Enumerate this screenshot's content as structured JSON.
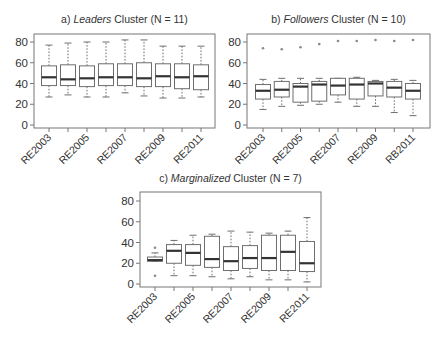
{
  "chart_data": [
    {
      "type": "boxplot",
      "panel": "a",
      "title_prefix": "a) ",
      "title_italic": "Leaders",
      "title_suffix": " Cluster (N = 11)",
      "xlabel": "",
      "ylabel": "",
      "ylim": [
        0,
        85
      ],
      "yticks": [
        0,
        20,
        40,
        60,
        80
      ],
      "categories": [
        "RE2003",
        "RE2004",
        "RE2005",
        "RE2006",
        "RE2007",
        "RE2008",
        "RE2009",
        "RE2010",
        "RE2011"
      ],
      "tick_labels": [
        "RE2003",
        "",
        "RE2005",
        "",
        "RE2007",
        "",
        "RE2009",
        "",
        "RE2011"
      ],
      "series": [
        {
          "min": 27,
          "q1": 38,
          "median": 46,
          "q3": 57,
          "max": 77,
          "outliers": []
        },
        {
          "min": 29,
          "q1": 38,
          "median": 44,
          "q3": 58,
          "max": 79,
          "outliers": []
        },
        {
          "min": 27,
          "q1": 37,
          "median": 45,
          "q3": 57,
          "max": 80,
          "outliers": []
        },
        {
          "min": 27,
          "q1": 38,
          "median": 46,
          "q3": 59,
          "max": 80,
          "outliers": []
        },
        {
          "min": 31,
          "q1": 38,
          "median": 46,
          "q3": 59,
          "max": 82,
          "outliers": []
        },
        {
          "min": 28,
          "q1": 37,
          "median": 45,
          "q3": 60,
          "max": 82,
          "outliers": []
        },
        {
          "min": 26,
          "q1": 37,
          "median": 47,
          "q3": 59,
          "max": 76,
          "outliers": []
        },
        {
          "min": 26,
          "q1": 35,
          "median": 46,
          "q3": 59,
          "max": 76,
          "outliers": []
        },
        {
          "min": 27,
          "q1": 34,
          "median": 47,
          "q3": 58,
          "max": 76,
          "outliers": []
        }
      ]
    },
    {
      "type": "boxplot",
      "panel": "b",
      "title_prefix": "b) ",
      "title_italic": "Followers",
      "title_suffix": " Cluster (N = 10)",
      "xlabel": "",
      "ylabel": "",
      "ylim": [
        0,
        85
      ],
      "yticks": [
        0,
        20,
        40,
        60,
        80
      ],
      "categories": [
        "RE2003",
        "RE2004",
        "RE2005",
        "RE2006",
        "RE2007",
        "RE2008",
        "RE2009",
        "RE2010",
        "RB2011"
      ],
      "tick_labels": [
        "RE2003",
        "",
        "RE2005",
        "",
        "RE2007",
        "",
        "RE2009",
        "",
        "RB2011"
      ],
      "series": [
        {
          "min": 15,
          "q1": 25,
          "median": 33,
          "q3": 39,
          "max": 44,
          "outliers": [
            74
          ]
        },
        {
          "min": 18,
          "q1": 27,
          "median": 34,
          "q3": 42,
          "max": 45,
          "outliers": [
            73
          ]
        },
        {
          "min": 19,
          "q1": 22,
          "median": 37,
          "q3": 40,
          "max": 45,
          "outliers": [
            75
          ]
        },
        {
          "min": 20,
          "q1": 23,
          "median": 39,
          "q3": 42,
          "max": 45,
          "outliers": [
            78
          ]
        },
        {
          "min": 22,
          "q1": 29,
          "median": 38,
          "q3": 45,
          "max": 45,
          "outliers": [
            81
          ]
        },
        {
          "min": 18,
          "q1": 25,
          "median": 39,
          "q3": 45,
          "max": 46,
          "outliers": [
            81
          ]
        },
        {
          "min": 18,
          "q1": 28,
          "median": 40,
          "q3": 42,
          "max": 43,
          "outliers": [
            82
          ]
        },
        {
          "min": 12,
          "q1": 27,
          "median": 36,
          "q3": 42,
          "max": 44,
          "outliers": [
            81
          ]
        },
        {
          "min": 9,
          "q1": 25,
          "median": 33,
          "q3": 40,
          "max": 43,
          "outliers": [
            82
          ]
        }
      ]
    },
    {
      "type": "boxplot",
      "panel": "c",
      "title_prefix": "c) ",
      "title_italic": "Marginalized",
      "title_suffix": " Cluster (N = 7)",
      "xlabel": "",
      "ylabel": "",
      "ylim": [
        0,
        85
      ],
      "yticks": [
        0,
        20,
        40,
        60,
        80
      ],
      "categories": [
        "RE2003",
        "RE2004",
        "RE2005",
        "RE2006",
        "RE2007",
        "RE2008",
        "RE2009",
        "RE2010",
        "RE2011"
      ],
      "tick_labels": [
        "RE2003",
        "",
        "RE2005",
        "",
        "RE2007",
        "",
        "RE2009",
        "",
        "RE2011"
      ],
      "series": [
        {
          "min": 22,
          "q1": 22,
          "median": 23,
          "q3": 26,
          "max": 30,
          "outliers": [
            35,
            8
          ]
        },
        {
          "min": 8,
          "q1": 20,
          "median": 32,
          "q3": 38,
          "max": 42,
          "outliers": []
        },
        {
          "min": 8,
          "q1": 18,
          "median": 30,
          "q3": 38,
          "max": 47,
          "outliers": []
        },
        {
          "min": 7,
          "q1": 16,
          "median": 24,
          "q3": 46,
          "max": 48,
          "outliers": []
        },
        {
          "min": 5,
          "q1": 13,
          "median": 22,
          "q3": 36,
          "max": 51,
          "outliers": []
        },
        {
          "min": 7,
          "q1": 15,
          "median": 25,
          "q3": 37,
          "max": 50,
          "outliers": []
        },
        {
          "min": 4,
          "q1": 13,
          "median": 25,
          "q3": 47,
          "max": 49,
          "outliers": []
        },
        {
          "min": 4,
          "q1": 13,
          "median": 31,
          "q3": 47,
          "max": 51,
          "outliers": []
        },
        {
          "min": 2,
          "q1": 12,
          "median": 20,
          "q3": 41,
          "max": 64,
          "outliers": []
        }
      ]
    }
  ],
  "layout": [
    {
      "left": 34,
      "right": 215,
      "top": 34,
      "bottom": 128,
      "y0": 125,
      "y80": 42,
      "title_y": 23,
      "first_tick_x": 49,
      "tick_step": 19.0
    },
    {
      "left": 247,
      "right": 430,
      "top": 34,
      "bottom": 128,
      "y0": 125,
      "y80": 42,
      "title_y": 23,
      "first_tick_x": 263,
      "tick_step": 18.75
    },
    {
      "left": 140,
      "right": 321,
      "top": 192,
      "bottom": 287,
      "y0": 284,
      "y80": 201,
      "title_y": 182,
      "first_tick_x": 155,
      "tick_step": 19.0
    }
  ]
}
